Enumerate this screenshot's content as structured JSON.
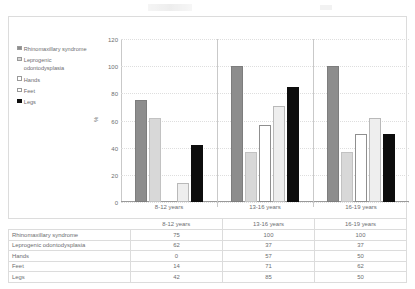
{
  "chart_data": {
    "type": "bar",
    "title": "",
    "xlabel": "",
    "ylabel": "%",
    "ylim": [
      0,
      120
    ],
    "yticks": [
      0,
      20,
      40,
      60,
      80,
      100,
      120
    ],
    "grid": true,
    "legend_position": "left",
    "categories": [
      "8-12 years",
      "13-16 years",
      "16-19 years"
    ],
    "series": [
      {
        "name": "Rhinomaxillary syndrome",
        "values": [
          75,
          100,
          100
        ],
        "color": "#8d8d8d"
      },
      {
        "name": "Leprogenic odontodysplasia",
        "values": [
          62,
          37,
          37
        ],
        "color": "#d8d8d8"
      },
      {
        "name": "Hands",
        "values": [
          0,
          57,
          50
        ],
        "color": "#ffffff"
      },
      {
        "name": "Feet",
        "values": [
          14,
          71,
          62
        ],
        "color": "#eeeeee"
      },
      {
        "name": "Legs",
        "values": [
          42,
          85,
          50
        ],
        "color": "#0d0d0d"
      }
    ]
  },
  "legend": {
    "items": [
      {
        "label": "Rhinomaxillary syndrome",
        "swatch": "legend-swatch-rhinomaxillary-syndrome"
      },
      {
        "label": "Leprogenic odontodysplasia",
        "swatch": "legend-swatch-leprogenic-odontodysplasia"
      },
      {
        "label": "Hands",
        "swatch": "legend-swatch-hands"
      },
      {
        "label": "Feet",
        "swatch": "legend-swatch-feet"
      },
      {
        "label": "Legs",
        "swatch": "legend-swatch-legs"
      }
    ]
  },
  "axis": {
    "y_title": "%",
    "y_ticks": [
      "120",
      "100",
      "80",
      "60",
      "40",
      "20",
      "0"
    ],
    "x_labels": [
      "8-12 years",
      "13-16 years",
      "16-19 years"
    ]
  },
  "table": {
    "columns": [
      "",
      "8-12 years",
      "13-16 years",
      "16-19 years"
    ],
    "rows": [
      {
        "label": "Rhinomaxillary syndrome",
        "values": [
          "75",
          "100",
          "100"
        ]
      },
      {
        "label": "Leprogenic odontodysplasia",
        "values": [
          "62",
          "37",
          "37"
        ]
      },
      {
        "label": "Hands",
        "values": [
          "0",
          "57",
          "50"
        ]
      },
      {
        "label": "Feet",
        "values": [
          "14",
          "71",
          "62"
        ]
      },
      {
        "label": "Legs",
        "values": [
          "42",
          "85",
          "50"
        ]
      }
    ]
  }
}
